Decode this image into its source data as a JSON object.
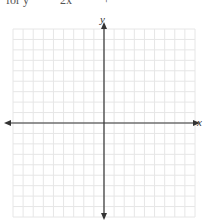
{
  "header": {
    "cut_text": [
      "for y",
      "2x",
      "+"
    ]
  },
  "graph": {
    "x_label": "x",
    "y_label": "y",
    "grid": {
      "left": 13,
      "right": 195,
      "top": 29,
      "bottom": 217,
      "columns": 18,
      "rows": 18,
      "line_color": "#e6e6e6"
    },
    "origin": {
      "x": 104,
      "y": 123
    },
    "axis_color": "#333333"
  }
}
